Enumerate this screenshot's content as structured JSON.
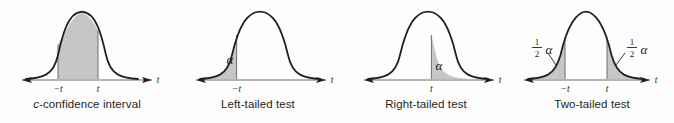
{
  "figure": {
    "background_color": "#fdfdfd",
    "curve_color": "#231f20",
    "axis_color": "#b5b5b5",
    "shade_color": "#c6c6c6",
    "shade_border_color": "#6f6f6f",
    "text_color": "#231f20"
  },
  "panels": [
    {
      "id": "c-confidence-interval",
      "caption_prefix": "c",
      "caption_rest": "-confidence interval",
      "caption_full": "c-confidence interval",
      "axis_label": "t",
      "tick_labels": [
        "−t",
        "t"
      ],
      "region": "center",
      "region_description": "area between −t and t is shaded",
      "area_labels": []
    },
    {
      "id": "left-tailed-test",
      "caption_prefix": "",
      "caption_rest": "Left-tailed test",
      "caption_full": "Left-tailed test",
      "axis_label": "t",
      "tick_labels": [
        "−t"
      ],
      "region": "left-tail",
      "region_description": "area to the left of −t is shaded",
      "area_labels": [
        {
          "text": "α",
          "kind": "alpha",
          "position": "inside-left-tail"
        }
      ]
    },
    {
      "id": "right-tailed-test",
      "caption_prefix": "",
      "caption_rest": "Right-tailed test",
      "caption_full": "Right-tailed test",
      "axis_label": "t",
      "tick_labels": [
        "t"
      ],
      "region": "right-tail",
      "region_description": "area to the right of t is shaded",
      "area_labels": [
        {
          "text": "α",
          "kind": "alpha",
          "position": "inside-right-tail"
        }
      ]
    },
    {
      "id": "two-tailed-test",
      "caption_prefix": "",
      "caption_rest": "Two-tailed test",
      "caption_full": "Two-tailed test",
      "axis_label": "t",
      "tick_labels": [
        "−t",
        "t"
      ],
      "region": "both-tails",
      "region_description": "areas left of −t and right of t are shaded",
      "area_labels": [
        {
          "text": "½α",
          "kind": "half-alpha",
          "numerator": "1",
          "denominator": "2",
          "symbol": "α",
          "position": "left-tail-callout"
        },
        {
          "text": "½α",
          "kind": "half-alpha",
          "numerator": "1",
          "denominator": "2",
          "symbol": "α",
          "position": "right-tail-callout"
        }
      ]
    }
  ]
}
